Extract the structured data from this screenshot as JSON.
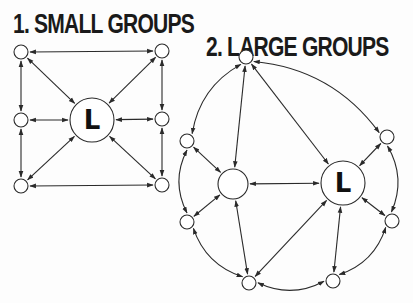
{
  "diagram": {
    "small_groups": {
      "title": "1. SMALL GROUPS",
      "leader_label": "L",
      "nodes": [
        {
          "id": "tl",
          "x": 21,
          "y": 52,
          "r": 7
        },
        {
          "id": "ml",
          "x": 21,
          "y": 120,
          "r": 7
        },
        {
          "id": "bl",
          "x": 21,
          "y": 186,
          "r": 7
        },
        {
          "id": "tr",
          "x": 162,
          "y": 51,
          "r": 7
        },
        {
          "id": "mr",
          "x": 162,
          "y": 119,
          "r": 7
        },
        {
          "id": "br",
          "x": 162,
          "y": 185,
          "r": 7
        },
        {
          "id": "L",
          "x": 92,
          "y": 120,
          "r": 22,
          "label": "L"
        }
      ],
      "edges": [
        [
          "tl",
          "tr"
        ],
        [
          "tl",
          "ml"
        ],
        [
          "ml",
          "bl"
        ],
        [
          "bl",
          "br"
        ],
        [
          "tr",
          "mr"
        ],
        [
          "mr",
          "br"
        ],
        [
          "tl",
          "L"
        ],
        [
          "ml",
          "L"
        ],
        [
          "bl",
          "L"
        ],
        [
          "tr",
          "L"
        ],
        [
          "mr",
          "L"
        ],
        [
          "br",
          "L"
        ]
      ]
    },
    "large_groups": {
      "title": "2. LARGE GROUPS",
      "leader_label": "L",
      "nodes": [
        {
          "id": "top",
          "x": 246,
          "y": 57,
          "r": 7
        },
        {
          "id": "lt",
          "x": 187,
          "y": 141,
          "r": 7
        },
        {
          "id": "lb",
          "x": 187,
          "y": 222,
          "r": 7
        },
        {
          "id": "bl",
          "x": 249,
          "y": 283,
          "r": 7
        },
        {
          "id": "br",
          "x": 333,
          "y": 281,
          "r": 7
        },
        {
          "id": "rb",
          "x": 392,
          "y": 221,
          "r": 7
        },
        {
          "id": "rt",
          "x": 387,
          "y": 137,
          "r": 7
        },
        {
          "id": "mid",
          "x": 233,
          "y": 184,
          "r": 15
        },
        {
          "id": "L",
          "x": 343,
          "y": 183,
          "r": 22,
          "label": "L"
        }
      ],
      "edges": [
        [
          "top",
          "rt"
        ],
        [
          "top",
          "lt"
        ],
        [
          "lt",
          "lb"
        ],
        [
          "lb",
          "bl"
        ],
        [
          "bl",
          "br"
        ],
        [
          "br",
          "rb"
        ],
        [
          "rb",
          "rt"
        ],
        [
          "top",
          "mid"
        ],
        [
          "top",
          "L"
        ],
        [
          "lt",
          "mid"
        ],
        [
          "lb",
          "mid"
        ],
        [
          "mid",
          "bl"
        ],
        [
          "mid",
          "L"
        ],
        [
          "bl",
          "L"
        ],
        [
          "br",
          "L"
        ],
        [
          "rb",
          "L"
        ],
        [
          "rt",
          "L"
        ]
      ]
    }
  }
}
